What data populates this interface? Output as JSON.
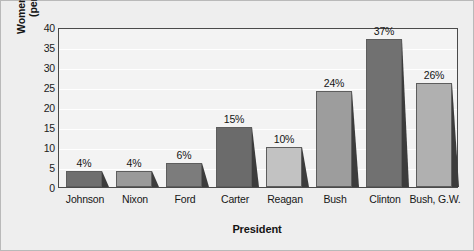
{
  "chart_data": {
    "type": "bar",
    "title": "",
    "xlabel": "President",
    "ylabel": "Women Appointees (percentage)",
    "ylabel_line1": "Women Appointees",
    "ylabel_line2": "(percentage)",
    "categories": [
      "Johnson",
      "Nixon",
      "Ford",
      "Carter",
      "Reagan",
      "Bush",
      "Clinton",
      "Bush, G.W."
    ],
    "values": [
      4,
      4,
      6,
      15,
      10,
      24,
      37,
      26
    ],
    "data_labels": [
      "4%",
      "4%",
      "6%",
      "15%",
      "10%",
      "24%",
      "37%",
      "26%"
    ],
    "ylim": [
      0,
      40
    ],
    "ytick_values": [
      0,
      5,
      10,
      15,
      20,
      25,
      30,
      35,
      40
    ],
    "ytick_labels": [
      "0",
      "5",
      "10",
      "15",
      "20",
      "25",
      "30",
      "35",
      "40"
    ],
    "grid": true,
    "legend": "none",
    "bar_colors": [
      "#6f6f6f",
      "#9a9a9a",
      "#7c7c7c",
      "#6b6b6b",
      "#c2c2c2",
      "#9d9d9d",
      "#717171",
      "#b0b0b0"
    ],
    "shadow_color": "#3c3c3c",
    "plot_background": "#f3f3f3",
    "figure_background": "#eeeeee",
    "gridline_color": "#ffffff",
    "axis_color": "#4a4a4a"
  }
}
